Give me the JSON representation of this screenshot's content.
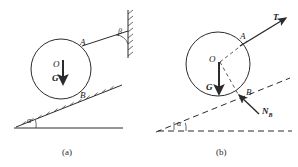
{
  "figure": {
    "stroke_color": "#2b2b2b",
    "panels": [
      {
        "id": "a",
        "caption": "(a)",
        "caption_pos": {
          "x": 62,
          "y": 148
        },
        "circle": {
          "cx": 61,
          "cy": 69,
          "r": 30
        },
        "labels": [
          {
            "name": "point-o",
            "text": "O",
            "x": 53,
            "y": 60,
            "kind": "point"
          },
          {
            "name": "point-a",
            "text": "A",
            "x": 80,
            "y": 38,
            "kind": "point"
          },
          {
            "name": "point-b",
            "text": "B",
            "x": 80,
            "y": 91,
            "kind": "point"
          },
          {
            "name": "weight-g",
            "text": "G",
            "x": 52,
            "y": 74,
            "kind": "vector"
          },
          {
            "name": "angle-alpha",
            "text": "α",
            "x": 27,
            "y": 117,
            "kind": "angle"
          },
          {
            "name": "angle-beta",
            "text": "β",
            "x": 118,
            "y": 28,
            "kind": "angle"
          }
        ]
      },
      {
        "id": "b",
        "caption": "(b)",
        "caption_pos": {
          "x": 216,
          "y": 148
        },
        "circle": {
          "cx": 218,
          "cy": 64,
          "r": 32
        },
        "labels": [
          {
            "name": "point-o",
            "text": "O",
            "x": 209,
            "y": 55,
            "kind": "point"
          },
          {
            "name": "point-a",
            "text": "A",
            "x": 240,
            "y": 32,
            "kind": "point"
          },
          {
            "name": "point-b",
            "text": "B",
            "x": 246,
            "y": 94,
            "kind": "point"
          },
          {
            "name": "weight-g",
            "text": "G",
            "x": 206,
            "y": 83,
            "kind": "vector"
          },
          {
            "name": "tension-t",
            "text": "T",
            "x": 273,
            "y": 13,
            "kind": "vector"
          },
          {
            "name": "normal-nb",
            "text": "N",
            "sub": "B",
            "x": 262,
            "y": 113,
            "kind": "vector"
          },
          {
            "name": "angle-alpha",
            "text": "α",
            "x": 177,
            "y": 120,
            "kind": "angle"
          }
        ]
      }
    ]
  }
}
